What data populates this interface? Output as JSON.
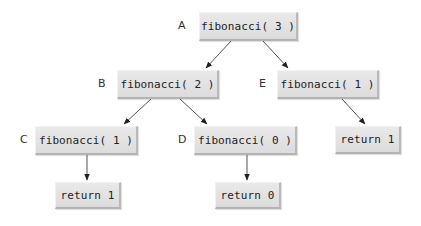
{
  "diagram": {
    "type": "recursion-tree",
    "nodes": [
      {
        "id": "A",
        "label": "A",
        "text": "fibonacci( 3 )"
      },
      {
        "id": "B",
        "label": "B",
        "text": "fibonacci( 2 )"
      },
      {
        "id": "E",
        "label": "E",
        "text": "fibonacci( 1 )"
      },
      {
        "id": "C",
        "label": "C",
        "text": "fibonacci( 1 )"
      },
      {
        "id": "D",
        "label": "D",
        "text": "fibonacci( 0 )"
      },
      {
        "id": "RC",
        "label": "",
        "text": "return 1"
      },
      {
        "id": "RD",
        "label": "",
        "text": "return 0"
      },
      {
        "id": "RE",
        "label": "",
        "text": "return 1"
      }
    ],
    "edges": [
      {
        "from": "A",
        "to": "B"
      },
      {
        "from": "A",
        "to": "E"
      },
      {
        "from": "B",
        "to": "C"
      },
      {
        "from": "B",
        "to": "D"
      },
      {
        "from": "E",
        "to": "RE"
      },
      {
        "from": "C",
        "to": "RC"
      },
      {
        "from": "D",
        "to": "RD"
      }
    ],
    "colors": {
      "box_fill": "#e3e3e3",
      "box_shadow": "#b5b5b5",
      "arrow": "#333333",
      "text": "#222222"
    }
  }
}
